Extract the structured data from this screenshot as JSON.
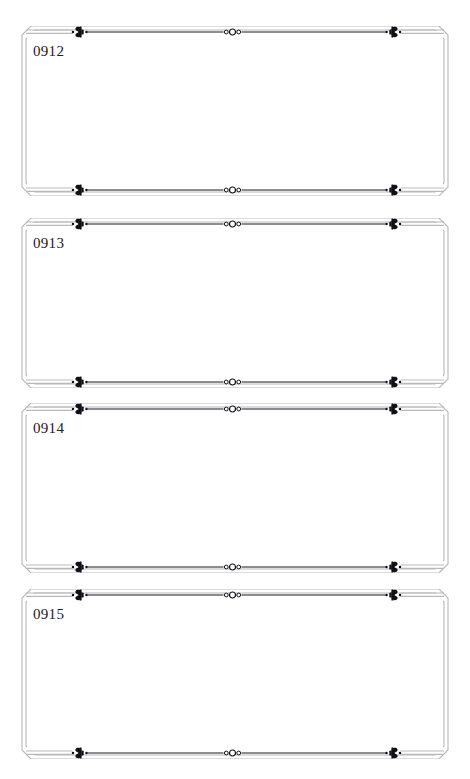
{
  "page": {
    "background_color": "#ffffff",
    "width": 470,
    "height": 779
  },
  "style": {
    "border_color": "#b9b9bd",
    "rule_color": "#1a1a22",
    "ornament_color": "#101018",
    "label_color": "#20202a",
    "circle_fill": "#ffffff",
    "circle_stroke": "#101018"
  },
  "ornaments": {
    "left_name": "fleuron-left-icon",
    "right_name": "fleuron-right-icon",
    "center_name": "triple-circle-ornament-icon",
    "left_glyph": "❦",
    "right_glyph": "❧",
    "center_glyph": "o◯o"
  },
  "frames": [
    {
      "label": "0912",
      "top": 26,
      "height": 170
    },
    {
      "label": "0913",
      "top": 218,
      "height": 170
    },
    {
      "label": "0914",
      "top": 403,
      "height": 170
    },
    {
      "label": "0915",
      "top": 589,
      "height": 170
    }
  ]
}
